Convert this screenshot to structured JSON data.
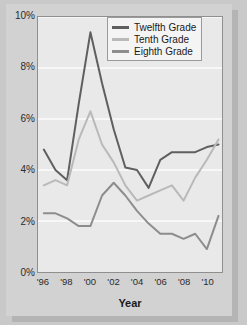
{
  "chart_data": {
    "type": "line",
    "title": "",
    "xlabel": "Year",
    "ylabel": "",
    "x": [
      1996,
      1997,
      1998,
      1999,
      2000,
      2001,
      2002,
      2003,
      2004,
      2005,
      2006,
      2007,
      2008,
      2009,
      2010,
      2011
    ],
    "xlim": [
      1995.5,
      2011.3
    ],
    "ylim": [
      0,
      10
    ],
    "xticks": [
      1996,
      1998,
      2000,
      2002,
      2004,
      2006,
      2008,
      2010
    ],
    "xtick_labels": [
      "'96",
      "'98",
      "'00",
      "'02",
      "'04",
      "'06",
      "'08",
      "'10"
    ],
    "yticks": [
      0,
      2,
      4,
      6,
      8,
      10
    ],
    "ytick_labels": [
      "0%",
      "2%",
      "4%",
      "6%",
      "8%",
      "10%"
    ],
    "grid": "horizontal",
    "legend_position": "top-right",
    "units": "percent",
    "series": [
      {
        "name": "Twelfth Grade",
        "color": "#5f5f5f",
        "values": [
          4.8,
          4.0,
          3.6,
          6.6,
          9.4,
          7.4,
          5.6,
          4.1,
          4.0,
          3.3,
          4.4,
          4.7,
          4.7,
          4.7,
          4.9,
          5.0
        ]
      },
      {
        "name": "Tenth Grade",
        "color": "#b9b9b9",
        "values": [
          3.4,
          3.6,
          3.4,
          5.2,
          6.3,
          5.0,
          4.3,
          3.4,
          2.8,
          3.0,
          3.2,
          3.4,
          2.8,
          3.7,
          4.4,
          5.2
        ]
      },
      {
        "name": "Eighth Grade",
        "color": "#8d8d8d",
        "values": [
          2.3,
          2.3,
          2.1,
          1.8,
          1.8,
          3.0,
          3.5,
          3.0,
          2.4,
          1.9,
          1.5,
          1.5,
          1.3,
          1.5,
          0.9,
          2.2
        ]
      }
    ]
  },
  "legend": {
    "entries": [
      {
        "label": "Twelfth Grade"
      },
      {
        "label": "Tenth Grade"
      },
      {
        "label": "Eighth Grade"
      }
    ]
  }
}
